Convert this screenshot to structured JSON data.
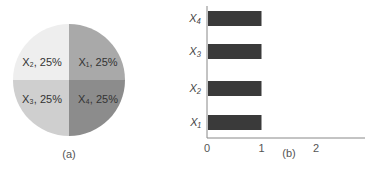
{
  "chart_data": [
    {
      "type": "pie",
      "title": "",
      "caption": "(a)",
      "labels": [
        "X1",
        "X2",
        "X3",
        "X4"
      ],
      "slice_labels": [
        "X₁, 25%",
        "X₂, 25%",
        "X₃, 25%",
        "X₄, 25%"
      ],
      "values": [
        25,
        25,
        25,
        25
      ],
      "colors": [
        "#a9a9a9",
        "#eeeeee",
        "#cfcfcf",
        "#8c8c8c"
      ]
    },
    {
      "type": "bar",
      "orientation": "horizontal",
      "caption": "(b)",
      "categories": [
        "X₁",
        "X₂",
        "X₃",
        "X₄"
      ],
      "values": [
        1,
        1,
        1,
        1
      ],
      "xlabel": "",
      "ylabel": "",
      "xlim": [
        0,
        2.9
      ],
      "xticks": [
        "0",
        "1",
        "2"
      ],
      "bar_color": "#3a3a3a",
      "grid": false
    }
  ]
}
